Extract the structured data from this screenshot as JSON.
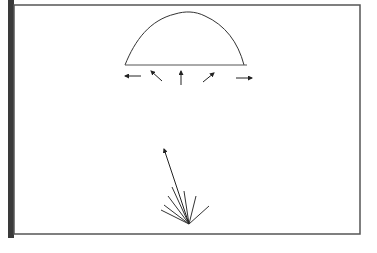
{
  "diagram": {
    "title": "",
    "colors": {
      "line": "#333333",
      "frame": "#555555",
      "side_bar": "#3a3a3a",
      "background": "#ffffff"
    },
    "frame": {
      "x": 14,
      "y": 5,
      "width": 346,
      "height": 229
    },
    "dome": {
      "baseline": {
        "x1": 125,
        "y1": 65,
        "x2": 247,
        "y2": 65
      },
      "path": "M125,65 C135,40 150,20 175,14 C185,11 195,11 205,16 C225,25 238,42 244,65"
    },
    "dome_arrows": [
      {
        "name": "left",
        "x1": 141,
        "y1": 76,
        "x2": 125,
        "y2": 76
      },
      {
        "name": "up-left",
        "x1": 162,
        "y1": 81,
        "x2": 151,
        "y2": 71
      },
      {
        "name": "up",
        "x1": 181,
        "y1": 85,
        "x2": 181,
        "y2": 71
      },
      {
        "name": "up-right",
        "x1": 203,
        "y1": 82,
        "x2": 214,
        "y2": 73
      },
      {
        "name": "right",
        "x1": 236,
        "y1": 78,
        "x2": 252,
        "y2": 78
      }
    ],
    "fan": {
      "origin": {
        "x": 189,
        "y": 224
      },
      "long_arrow_tip": {
        "x": 164,
        "y": 149
      },
      "rays": [
        {
          "x": 161,
          "y": 210
        },
        {
          "x": 164,
          "y": 205
        },
        {
          "x": 168,
          "y": 196
        },
        {
          "x": 172,
          "y": 187
        },
        {
          "x": 184,
          "y": 191
        },
        {
          "x": 196,
          "y": 196
        },
        {
          "x": 209,
          "y": 206
        }
      ]
    }
  }
}
